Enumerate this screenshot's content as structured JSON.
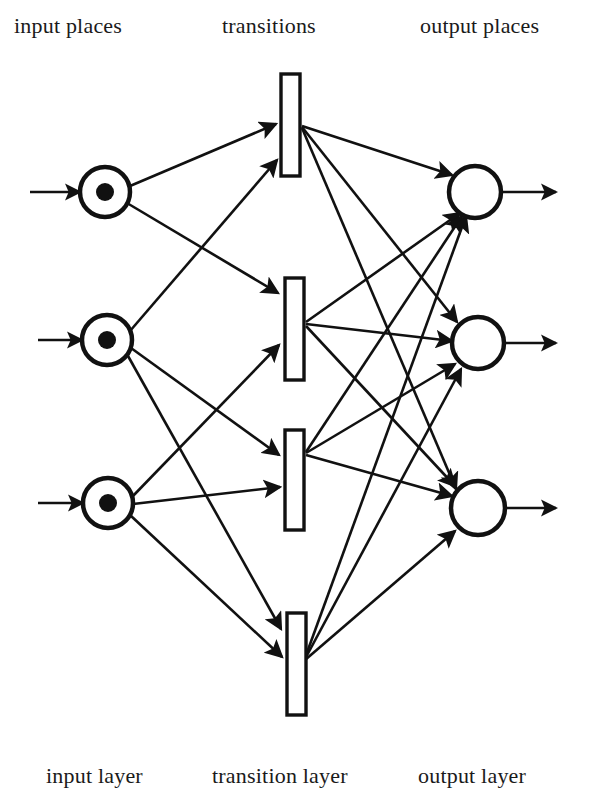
{
  "figure": {
    "type": "petri-net-diagram",
    "ink_color": "#111111",
    "background": "#ffffff"
  },
  "top_labels": {
    "input": "input places",
    "middle": "transitions",
    "output": "output places"
  },
  "bottom_labels": {
    "input": "input layer",
    "middle": "transition layer",
    "output": "output layer"
  },
  "graph": {
    "input_places": [
      {
        "id": "p1",
        "cx": 105,
        "cy": 192,
        "r": 25,
        "token": true,
        "token_r": 9
      },
      {
        "id": "p2",
        "cx": 107,
        "cy": 340,
        "r": 25,
        "token": true,
        "token_r": 9
      },
      {
        "id": "p3",
        "cx": 108,
        "cy": 503,
        "r": 25,
        "token": true,
        "token_r": 9
      }
    ],
    "transitions": [
      {
        "id": "t1",
        "x": 281,
        "y": 74,
        "w": 19,
        "h": 102
      },
      {
        "id": "t2",
        "x": 285,
        "y": 278,
        "w": 19,
        "h": 102
      },
      {
        "id": "t3",
        "x": 285,
        "y": 430,
        "w": 19,
        "h": 100
      },
      {
        "id": "t4",
        "x": 287,
        "y": 613,
        "w": 19,
        "h": 102
      }
    ],
    "output_places": [
      {
        "id": "o1",
        "cx": 475,
        "cy": 192,
        "r": 26,
        "token": false
      },
      {
        "id": "o2",
        "cx": 478,
        "cy": 343,
        "r": 26,
        "token": false
      },
      {
        "id": "o3",
        "cx": 478,
        "cy": 508,
        "r": 27,
        "token": false
      }
    ],
    "source_arrows": [
      {
        "from": "source-1",
        "to": "p1",
        "x1": 30,
        "y1": 192,
        "x2": 80,
        "y2": 192
      },
      {
        "from": "source-2",
        "to": "p2",
        "x1": 38,
        "y1": 340,
        "x2": 82,
        "y2": 340
      },
      {
        "from": "source-3",
        "to": "p3",
        "x1": 38,
        "y1": 503,
        "x2": 83,
        "y2": 503
      }
    ],
    "sink_arrows": [
      {
        "from": "o1",
        "to": "sink-1",
        "x1": 501,
        "y1": 192,
        "x2": 556,
        "y2": 192
      },
      {
        "from": "o2",
        "to": "sink-2",
        "x1": 504,
        "y1": 343,
        "x2": 556,
        "y2": 343
      },
      {
        "from": "o3",
        "to": "sink-3",
        "x1": 505,
        "y1": 508,
        "x2": 556,
        "y2": 508
      }
    ],
    "place_to_transition_arcs": [
      {
        "from": "p1",
        "to": "t1",
        "x1": 130,
        "y1": 186,
        "x2": 276,
        "y2": 124
      },
      {
        "from": "p1",
        "to": "t2",
        "x1": 127,
        "y1": 203,
        "x2": 278,
        "y2": 293
      },
      {
        "from": "p2",
        "to": "t1",
        "x1": 130,
        "y1": 331,
        "x2": 277,
        "y2": 160
      },
      {
        "from": "p2",
        "to": "t3",
        "x1": 131,
        "y1": 348,
        "x2": 279,
        "y2": 455
      },
      {
        "from": "p2",
        "to": "t4",
        "x1": 128,
        "y1": 356,
        "x2": 281,
        "y2": 629
      },
      {
        "from": "p3",
        "to": "t2",
        "x1": 132,
        "y1": 497,
        "x2": 279,
        "y2": 345
      },
      {
        "from": "p3",
        "to": "t3",
        "x1": 133,
        "y1": 504,
        "x2": 280,
        "y2": 487
      },
      {
        "from": "p3",
        "to": "t4",
        "x1": 130,
        "y1": 515,
        "x2": 282,
        "y2": 657
      }
    ],
    "transition_to_place_arcs": [
      {
        "from": "t1",
        "to": "o1",
        "x1": 302,
        "y1": 126,
        "x2": 452,
        "y2": 175
      },
      {
        "from": "t1",
        "to": "o2",
        "x1": 302,
        "y1": 127,
        "x2": 457,
        "y2": 322
      },
      {
        "from": "t1",
        "to": "o3",
        "x1": 302,
        "y1": 128,
        "x2": 456,
        "y2": 489
      },
      {
        "from": "t2",
        "to": "o1",
        "x1": 306,
        "y1": 322,
        "x2": 460,
        "y2": 213
      },
      {
        "from": "t2",
        "to": "o2",
        "x1": 306,
        "y1": 324,
        "x2": 452,
        "y2": 341
      },
      {
        "from": "t2",
        "to": "o3",
        "x1": 306,
        "y1": 326,
        "x2": 455,
        "y2": 486
      },
      {
        "from": "t3",
        "to": "o1",
        "x1": 306,
        "y1": 452,
        "x2": 462,
        "y2": 216
      },
      {
        "from": "t3",
        "to": "o2",
        "x1": 306,
        "y1": 453,
        "x2": 455,
        "y2": 364
      },
      {
        "from": "t3",
        "to": "o3",
        "x1": 306,
        "y1": 455,
        "x2": 452,
        "y2": 496
      },
      {
        "from": "t4",
        "to": "o1",
        "x1": 305,
        "y1": 658,
        "x2": 466,
        "y2": 216
      },
      {
        "from": "t4",
        "to": "o2",
        "x1": 305,
        "y1": 659,
        "x2": 461,
        "y2": 369
      },
      {
        "from": "t4",
        "to": "o3",
        "x1": 305,
        "y1": 660,
        "x2": 455,
        "y2": 531
      }
    ]
  }
}
